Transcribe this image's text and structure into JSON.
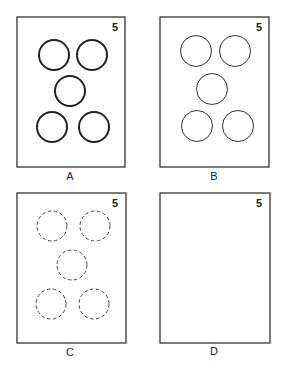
{
  "panels": [
    {
      "label": "A",
      "number": "5",
      "circle_style": "thick-solid",
      "circle_count": 5
    },
    {
      "label": "B",
      "number": "5",
      "circle_style": "thin-solid",
      "circle_count": 5
    },
    {
      "label": "C",
      "number": "5",
      "circle_style": "dashed",
      "circle_count": 5
    },
    {
      "label": "D",
      "number": "5",
      "circle_style": "none",
      "circle_count": 0
    }
  ],
  "colors": {
    "stroke": "#222222",
    "background": "#ffffff"
  }
}
